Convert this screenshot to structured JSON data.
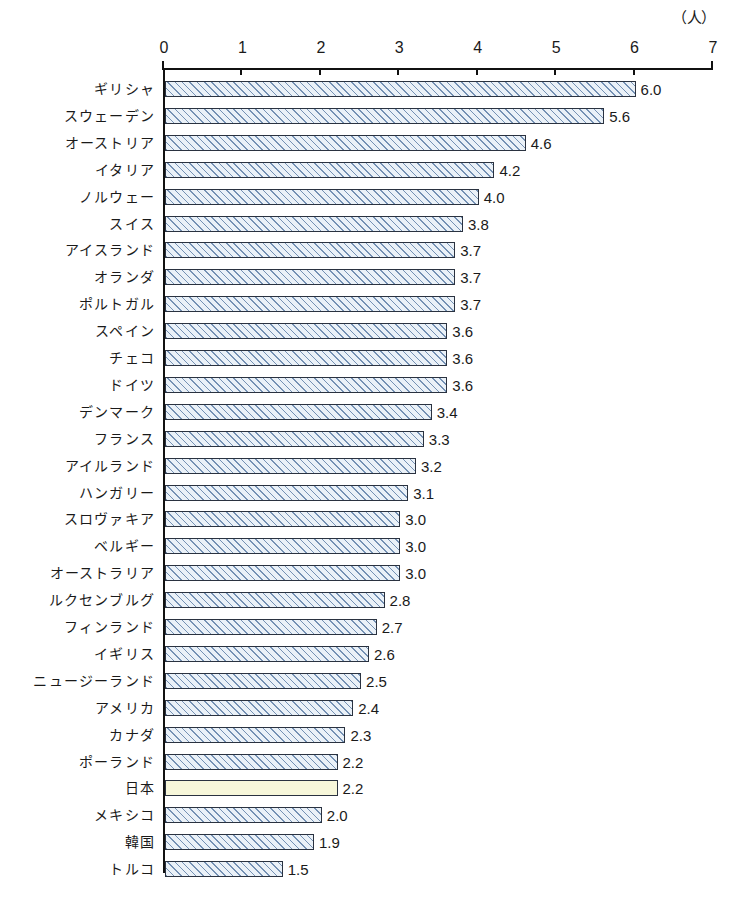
{
  "chart_data": {
    "type": "bar",
    "orientation": "horizontal",
    "title": "",
    "subtitle": "",
    "xlabel": "",
    "ylabel": "",
    "unit_label": "（人）",
    "xlim": [
      0,
      7
    ],
    "xticks": [
      "0",
      "1",
      "2",
      "3",
      "4",
      "5",
      "6",
      "7"
    ],
    "xtick_values": [
      0,
      1,
      2,
      3,
      4,
      5,
      6,
      7
    ],
    "grid": false,
    "legend": "none",
    "highlight_category": "日本",
    "categories": [
      "ギリシャ",
      "スウェーデン",
      "オーストリア",
      "イタリア",
      "ノルウェー",
      "スイス",
      "アイスランド",
      "オランダ",
      "ポルトガル",
      "スペイン",
      "チェコ",
      "ドイツ",
      "デンマーク",
      "フランス",
      "アイルランド",
      "ハンガリー",
      "スロヴァキア",
      "ベルギー",
      "オーストラリア",
      "ルクセンブルグ",
      "フィンランド",
      "イギリス",
      "ニュージーランド",
      "アメリカ",
      "カナダ",
      "ポーランド",
      "日本",
      "メキシコ",
      "韓国",
      "トルコ"
    ],
    "values": [
      6.0,
      5.6,
      4.6,
      4.2,
      4.0,
      3.8,
      3.7,
      3.7,
      3.7,
      3.6,
      3.6,
      3.6,
      3.4,
      3.3,
      3.2,
      3.1,
      3.0,
      3.0,
      3.0,
      2.8,
      2.7,
      2.6,
      2.5,
      2.4,
      2.3,
      2.2,
      2.2,
      2.0,
      1.9,
      1.5
    ],
    "value_labels": [
      "6.0",
      "5.6",
      "4.6",
      "4.2",
      "4.0",
      "3.8",
      "3.7",
      "3.7",
      "3.7",
      "3.6",
      "3.6",
      "3.6",
      "3.4",
      "3.3",
      "3.2",
      "3.1",
      "3.0",
      "3.0",
      "3.0",
      "2.8",
      "2.7",
      "2.6",
      "2.5",
      "2.4",
      "2.3",
      "2.2",
      "2.2",
      "2.0",
      "1.9",
      "1.5"
    ],
    "colors": {
      "bar_fill": "#eaf1f8",
      "bar_hatch": "#6080a8",
      "bar_border": "#2a3240",
      "highlight_fill": "#f7f7da",
      "axis": "#111111",
      "text": "#1a1a1a"
    }
  }
}
